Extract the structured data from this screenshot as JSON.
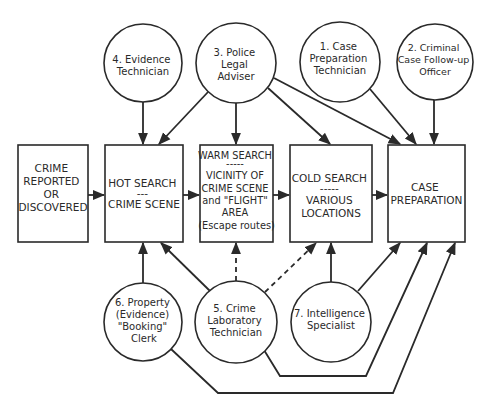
{
  "colors": {
    "ink": "#2a2a2a",
    "background": "#ffffff"
  },
  "stages": [
    {
      "id": "crime",
      "lines": [
        "CRIME",
        "REPORTED",
        "OR",
        "DISCOVERED"
      ]
    },
    {
      "id": "hot",
      "lines": [
        "HOT SEARCH",
        "---",
        "CRIME SCENE"
      ]
    },
    {
      "id": "warm",
      "lines": [
        "WARM SEARCH",
        "-----",
        "VICINITY OF",
        "CRIME SCENE",
        "and \"FLIGHT\"",
        "AREA",
        "(Escape routes)"
      ]
    },
    {
      "id": "cold",
      "lines": [
        "COLD SEARCH",
        "-----",
        "VARIOUS",
        "LOCATIONS"
      ]
    },
    {
      "id": "case",
      "lines": [
        "CASE",
        "PREPARATION"
      ]
    }
  ],
  "roles_top": [
    {
      "id": "r4",
      "lines": [
        "4. Evidence",
        "Technician"
      ]
    },
    {
      "id": "r3",
      "lines": [
        "3. Police",
        "Legal",
        "Adviser"
      ]
    },
    {
      "id": "r1",
      "lines": [
        "1. Case",
        "Preparation",
        "Technician"
      ]
    },
    {
      "id": "r2",
      "lines": [
        "2. Criminal",
        "Case Follow-up",
        "Officer"
      ]
    }
  ],
  "roles_bottom": [
    {
      "id": "r6",
      "lines": [
        "6. Property",
        "(Evidence)",
        "\"Booking\"",
        "Clerk"
      ]
    },
    {
      "id": "r5",
      "lines": [
        "5. Crime",
        "Laboratory",
        "Technician"
      ]
    },
    {
      "id": "r7",
      "lines": [
        "7. Intelligence",
        "Specialist"
      ]
    }
  ],
  "edges": [
    {
      "from": "crime",
      "to": "hot",
      "style": "solid"
    },
    {
      "from": "hot",
      "to": "warm",
      "style": "solid"
    },
    {
      "from": "warm",
      "to": "cold",
      "style": "solid"
    },
    {
      "from": "cold",
      "to": "case",
      "style": "solid"
    },
    {
      "from": "r4",
      "to": "hot",
      "style": "solid"
    },
    {
      "from": "r3",
      "to": "hot",
      "style": "solid"
    },
    {
      "from": "r3",
      "to": "warm",
      "style": "solid"
    },
    {
      "from": "r3",
      "to": "cold",
      "style": "solid"
    },
    {
      "from": "r3",
      "to": "case",
      "style": "solid"
    },
    {
      "from": "r1",
      "to": "case",
      "style": "solid"
    },
    {
      "from": "r2",
      "to": "case",
      "style": "solid"
    },
    {
      "from": "r6",
      "to": "hot",
      "style": "solid"
    },
    {
      "from": "r6",
      "to": "case",
      "style": "solid"
    },
    {
      "from": "r5",
      "to": "hot",
      "style": "solid"
    },
    {
      "from": "r5",
      "to": "warm",
      "style": "dashed"
    },
    {
      "from": "r5",
      "to": "cold",
      "style": "dashed"
    },
    {
      "from": "r5",
      "to": "case",
      "style": "solid"
    },
    {
      "from": "r7",
      "to": "cold",
      "style": "solid"
    },
    {
      "from": "r7",
      "to": "case",
      "style": "solid"
    }
  ]
}
